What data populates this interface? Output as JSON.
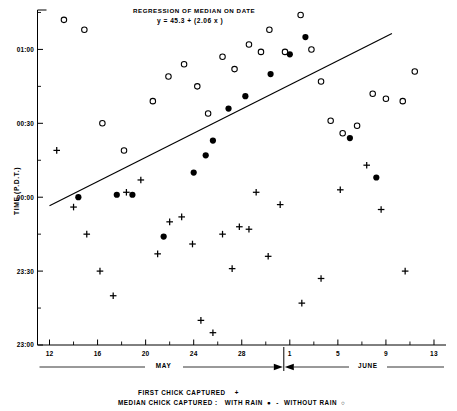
{
  "chart_data": {
    "type": "scatter",
    "title": "REGRESSION OF MEDIAN ON DATE",
    "equation": "y = 45.3 + (2.06 x )",
    "xlabel": "",
    "ylabel": "TIME (P.D.T.)",
    "x_tick_labels": [
      "12",
      "16",
      "20",
      "24",
      "28",
      "1",
      "5",
      "9",
      "13"
    ],
    "x_tick_values": [
      12,
      16,
      20,
      24,
      28,
      32,
      36,
      40,
      44
    ],
    "xlim": [
      11,
      45
    ],
    "y_tick_labels": [
      "23:00",
      "23:30",
      "00:00",
      "00:30",
      "01:00"
    ],
    "y_tick_values": [
      0,
      30,
      60,
      90,
      120
    ],
    "ylim": [
      0,
      136
    ],
    "grid": false,
    "month_axis": [
      {
        "label": "MAY",
        "start": 11,
        "end": 31.5
      },
      {
        "label": "JUNE",
        "start": 31.5,
        "end": 45
      }
    ],
    "series": [
      {
        "name": "FIRST CHICK CAPTURED",
        "marker": "plus",
        "points": [
          [
            12.6,
            79
          ],
          [
            14.0,
            56
          ],
          [
            15.1,
            45
          ],
          [
            16.2,
            30
          ],
          [
            17.3,
            20
          ],
          [
            18.4,
            62
          ],
          [
            19.6,
            67
          ],
          [
            21.0,
            37
          ],
          [
            22.0,
            50
          ],
          [
            23.0,
            52
          ],
          [
            23.9,
            41
          ],
          [
            24.6,
            10
          ],
          [
            25.6,
            5
          ],
          [
            26.4,
            45
          ],
          [
            27.2,
            31
          ],
          [
            27.8,
            48
          ],
          [
            28.6,
            47
          ],
          [
            29.2,
            62
          ],
          [
            30.2,
            36
          ],
          [
            31.2,
            57
          ],
          [
            33.0,
            17
          ],
          [
            34.6,
            27
          ],
          [
            36.2,
            63
          ],
          [
            38.4,
            73
          ],
          [
            39.6,
            55
          ],
          [
            41.6,
            30
          ]
        ]
      },
      {
        "name": "MEDIAN CHICK CAPTURED : WITH RAIN",
        "marker": "filled-circle",
        "points": [
          [
            14.4,
            60
          ],
          [
            17.6,
            61
          ],
          [
            18.9,
            61
          ],
          [
            21.5,
            44
          ],
          [
            24.0,
            70
          ],
          [
            25.0,
            77
          ],
          [
            25.6,
            83
          ],
          [
            26.9,
            96
          ],
          [
            28.3,
            101
          ],
          [
            30.4,
            110
          ],
          [
            32.0,
            118
          ],
          [
            33.3,
            125
          ],
          [
            37.0,
            84
          ],
          [
            39.2,
            68
          ]
        ]
      },
      {
        "name": "MEDIAN CHICK CAPTURED : WITHOUT RAIN",
        "marker": "open-circle",
        "points": [
          [
            13.2,
            132
          ],
          [
            14.9,
            128
          ],
          [
            16.4,
            90
          ],
          [
            18.2,
            79
          ],
          [
            20.6,
            99
          ],
          [
            21.9,
            109
          ],
          [
            23.2,
            114
          ],
          [
            24.3,
            105
          ],
          [
            25.2,
            94
          ],
          [
            26.4,
            117
          ],
          [
            27.4,
            112
          ],
          [
            28.6,
            122
          ],
          [
            29.6,
            119
          ],
          [
            30.3,
            128
          ],
          [
            31.6,
            119
          ],
          [
            32.9,
            134
          ],
          [
            33.8,
            120
          ],
          [
            34.6,
            107
          ],
          [
            35.4,
            91
          ],
          [
            36.4,
            86
          ],
          [
            37.6,
            89
          ],
          [
            38.9,
            102
          ],
          [
            40.0,
            100
          ],
          [
            41.4,
            99
          ],
          [
            42.4,
            111
          ]
        ]
      }
    ],
    "regression_line": {
      "x1": 12.0,
      "y1": 56.5,
      "x2": 40.5,
      "y2": 126.5
    },
    "legend": [
      {
        "label": "FIRST CHICK CAPTURED",
        "marker": "plus"
      },
      {
        "label": "MEDIAN CHICK CAPTURED :",
        "marker": "none"
      },
      {
        "label": "WITH RAIN",
        "marker": "filled-circle"
      },
      {
        "label": "-",
        "marker": "none"
      },
      {
        "label": "WITHOUT RAIN",
        "marker": "open-circle"
      }
    ]
  }
}
